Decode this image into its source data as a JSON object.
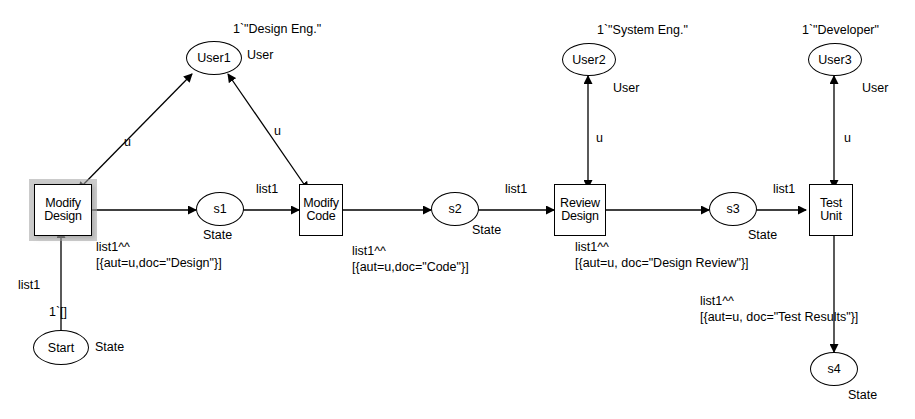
{
  "diagram": {
    "stroke_color": "#000000",
    "background_color": "#ffffff",
    "highlight_color": "#a0a0a0"
  },
  "places": [
    {
      "id": "user1",
      "name": "User1",
      "colorset": "User",
      "marking": "1`\"Design Eng.\""
    },
    {
      "id": "user2",
      "name": "User2",
      "colorset": "User",
      "marking": "1`\"System Eng.\""
    },
    {
      "id": "user3",
      "name": "User3",
      "colorset": "User",
      "marking": "1`\"Developer\""
    },
    {
      "id": "start",
      "name": "Start",
      "colorset": "State",
      "marking": "1`[]"
    },
    {
      "id": "s1",
      "name": "s1",
      "colorset": "State",
      "marking": ""
    },
    {
      "id": "s2",
      "name": "s2",
      "colorset": "State",
      "marking": ""
    },
    {
      "id": "s3",
      "name": "s3",
      "colorset": "State",
      "marking": ""
    },
    {
      "id": "s4",
      "name": "s4",
      "colorset": "State",
      "marking": ""
    }
  ],
  "transitions": [
    {
      "id": "modify-design",
      "line1": "Modify",
      "line2": "Design",
      "selected": true
    },
    {
      "id": "modify-code",
      "line1": "Modify",
      "line2": "Code",
      "selected": false
    },
    {
      "id": "review-design",
      "line1": "Review",
      "line2": "Design",
      "selected": false
    },
    {
      "id": "test-unit",
      "line1": "Test",
      "line2": "Unit",
      "selected": false
    }
  ],
  "arc_inscriptions": {
    "start_to_modify_design": "list1",
    "modify_design_out": "list1^^\n[{aut=u,doc=\"Design\"}]",
    "s1_to_modify_code": "list1",
    "modify_code_out": "list1^^\n[{aut=u,doc=\"Code\"}]",
    "s2_to_review_design": "list1",
    "review_design_out": "list1^^\n[{aut=u, doc=\"Design Review\"}]",
    "s3_to_test_unit": "list1",
    "test_unit_out": "list1^^\n[{aut=u, doc=\"Test Results\"}]",
    "user1_left": "u",
    "user1_right": "u",
    "user2_arc": "u",
    "user3_arc": "u"
  }
}
